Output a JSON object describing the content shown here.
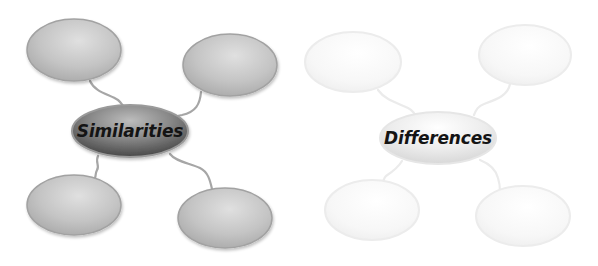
{
  "diagrams": [
    {
      "id": "similarities",
      "title": "Similarities",
      "theme": "gray",
      "colors": {
        "bubble_fill_light": "#d8d8d8",
        "bubble_fill_dark": "#a9a9a9",
        "bubble_stroke": "#9c9c9c",
        "center_fill_light": "#b0b0b0",
        "center_fill_dark": "#4a4a4a",
        "connector": "#a6a6a6"
      },
      "center": {
        "cx": 130,
        "cy": 131,
        "rx": 58,
        "ry": 26,
        "label": "Similarities"
      },
      "bubbles": [
        {
          "position": "top-left",
          "cx": 74,
          "cy": 50,
          "rx": 47,
          "ry": 31,
          "text": ""
        },
        {
          "position": "top-right",
          "cx": 230,
          "cy": 65,
          "rx": 47,
          "ry": 31,
          "text": ""
        },
        {
          "position": "bottom-left",
          "cx": 74,
          "cy": 205,
          "rx": 47,
          "ry": 30,
          "text": ""
        },
        {
          "position": "bottom-right",
          "cx": 225,
          "cy": 218,
          "rx": 47,
          "ry": 30,
          "text": ""
        }
      ]
    },
    {
      "id": "differences",
      "title": "Differences",
      "theme": "faded",
      "colors": {
        "bubble_fill_light": "#ffffff",
        "bubble_fill_dark": "#f2f2f2",
        "bubble_stroke": "#ececec",
        "center_fill_light": "#ffffff",
        "center_fill_dark": "#d9d9d9",
        "connector": "#ebebeb"
      },
      "center": {
        "cx": 438,
        "cy": 138,
        "rx": 58,
        "ry": 26,
        "label": "Differences"
      },
      "bubbles": [
        {
          "position": "top-left",
          "cx": 353,
          "cy": 62,
          "rx": 48,
          "ry": 30,
          "text": ""
        },
        {
          "position": "top-right",
          "cx": 525,
          "cy": 55,
          "rx": 46,
          "ry": 30,
          "text": ""
        },
        {
          "position": "bottom-left",
          "cx": 372,
          "cy": 210,
          "rx": 47,
          "ry": 30,
          "text": ""
        },
        {
          "position": "bottom-right",
          "cx": 523,
          "cy": 216,
          "rx": 47,
          "ry": 30,
          "text": ""
        }
      ]
    }
  ]
}
